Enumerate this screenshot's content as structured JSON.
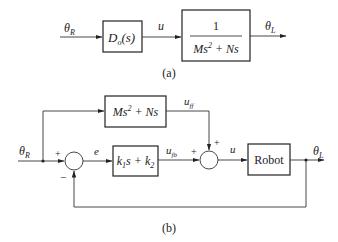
{
  "diagram_a": {
    "input_label": "θ",
    "input_sub": "R",
    "controller": {
      "main": "D",
      "sub": "o",
      "arg": "(s)"
    },
    "signal_u": "u",
    "plant": {
      "numerator": "1",
      "den_a": "Ms",
      "den_exp": "2",
      "den_b": " + Ns"
    },
    "output_label": "θ",
    "output_sub": "L",
    "caption": "(a)"
  },
  "diagram_b": {
    "input_label": "θ",
    "input_sub": "R",
    "feedforward": {
      "a": "Ms",
      "exp": "2",
      "b": " + Ns"
    },
    "uff_main": "u",
    "uff_sub": "ff",
    "sum1_plus": "+",
    "sum1_minus": "−",
    "error_label": "e",
    "feedback_ctrl": {
      "k1": "k",
      "k1_sub": "1",
      "mid": "s + k",
      "k2_sub": "2"
    },
    "ufb_main": "u",
    "ufb_sub": "fb",
    "sum2_plus_left": "+",
    "sum2_plus_top": "+",
    "signal_u": "u",
    "plant_label": "Robot",
    "output_label": "θ",
    "output_sub": "L",
    "caption": "(b)"
  }
}
